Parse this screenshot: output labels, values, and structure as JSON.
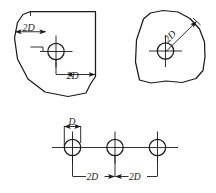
{
  "figure": {
    "background_color": "#ffffff",
    "line_color": "#1a1a1a",
    "views": [
      {
        "id": "view-top-left",
        "name": "irregular-plate-orthogonal-dimensions",
        "description": "Irregular plate outline with one hole dimensioned from top and right edges",
        "dimensions": [
          {
            "id": "dim-vertical-2d",
            "label": "2D",
            "orientation": "vertical",
            "from": "top-edge",
            "to": "hole-center"
          },
          {
            "id": "dim-horizontal-2d",
            "label": "2D",
            "orientation": "horizontal",
            "from": "hole-center",
            "to": "right-edge"
          }
        ],
        "holes": [
          {
            "id": "hole-1",
            "name": "hole-center-mark"
          }
        ]
      },
      {
        "id": "view-top-right",
        "name": "irregular-plate-diagonal-dimension",
        "description": "Irregular plate outline with one hole dimensioned diagonally to the edge",
        "dimensions": [
          {
            "id": "dim-diagonal-2d",
            "label": "2D",
            "orientation": "diagonal",
            "from": "hole-center",
            "to": "edge"
          }
        ],
        "holes": [
          {
            "id": "hole-1",
            "name": "hole-center-mark"
          }
        ]
      },
      {
        "id": "view-bottom",
        "name": "three-hole-row-spacing",
        "description": "Row of three holes on a common centerline with diameter and spacing dimensions",
        "dimensions": [
          {
            "id": "dim-diameter-d",
            "label": "D",
            "orientation": "horizontal",
            "from": "hole-1-left",
            "to": "hole-1-right"
          },
          {
            "id": "dim-spacing-2d-a",
            "label": "2D",
            "orientation": "horizontal",
            "from": "hole-1-center",
            "to": "hole-2-center"
          },
          {
            "id": "dim-spacing-2d-b",
            "label": "2D",
            "orientation": "horizontal",
            "from": "hole-2-center",
            "to": "hole-3-center"
          }
        ],
        "holes": [
          {
            "id": "hole-1",
            "name": "hole-center-mark"
          },
          {
            "id": "hole-2",
            "name": "hole-center-mark"
          },
          {
            "id": "hole-3",
            "name": "hole-center-mark"
          }
        ]
      }
    ],
    "labels": {
      "tl_vertical": "2D",
      "tl_horizontal": "2D",
      "tr_diagonal": "2D",
      "bottom_diameter": "D",
      "bottom_spacing_left": "2D",
      "bottom_spacing_right": "2D"
    }
  }
}
